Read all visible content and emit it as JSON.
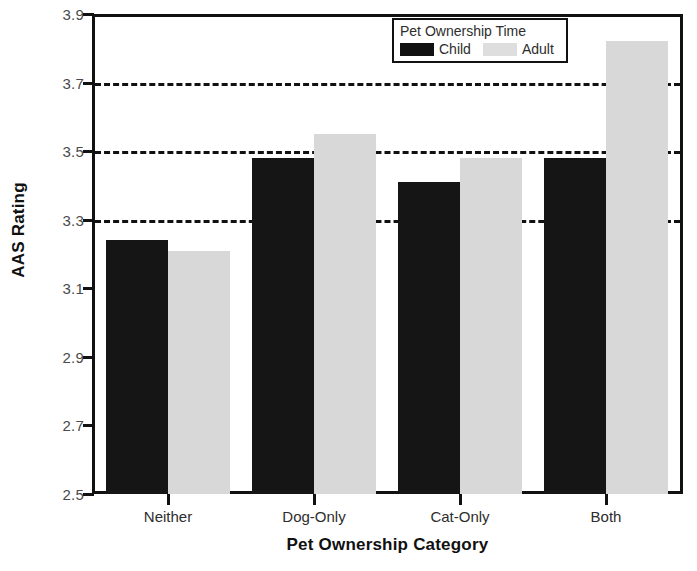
{
  "chart_data": {
    "type": "bar",
    "title": "",
    "xlabel": "Pet Ownership Category",
    "ylabel": "AAS Rating",
    "categories": [
      "Neither",
      "Dog-Only",
      "Cat-Only",
      "Both"
    ],
    "series": [
      {
        "name": "Child",
        "color": "#151515",
        "values": [
          3.24,
          3.48,
          3.41,
          3.48
        ]
      },
      {
        "name": "Adult",
        "color": "#d8d8d8",
        "values": [
          3.21,
          3.55,
          3.48,
          3.82
        ]
      }
    ],
    "ylim": [
      2.5,
      3.9
    ],
    "yticks": [
      2.5,
      2.7,
      2.9,
      3.1,
      3.3,
      3.5,
      3.7,
      3.9
    ],
    "ytick_labels": [
      "2.5",
      "2.7",
      "2.9",
      "3.1",
      "3.3",
      "3.5",
      "3.7",
      "3.9"
    ],
    "gridlines": [
      3.3,
      3.5,
      3.7,
      3.9
    ],
    "grid": true,
    "grid_style": "dashed",
    "legend": {
      "title": "Pet Ownership Time",
      "position": "top-right-inside",
      "entries": [
        {
          "label": "Child",
          "swatch": "black"
        },
        {
          "label": "Adult",
          "swatch": "light-gray"
        }
      ]
    }
  }
}
